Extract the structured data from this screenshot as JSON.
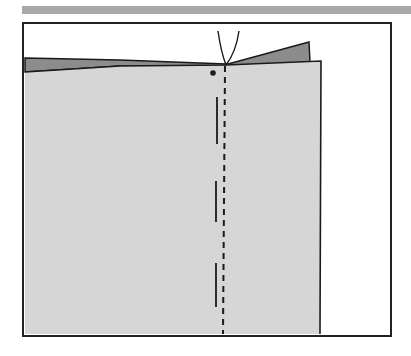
{
  "figure": {
    "type": "sewing-illustration",
    "colors": {
      "header_bar": "#a9a9a9",
      "frame_stroke": "#222222",
      "fabric_light": "#d6d6d6",
      "fabric_dark": "#8c8c8c",
      "line": "#1a1a1a",
      "background": "#ffffff"
    },
    "elements": [
      {
        "name": "header-bar"
      },
      {
        "name": "frame"
      },
      {
        "name": "fabric-under-layer"
      },
      {
        "name": "fabric-top-layer"
      },
      {
        "name": "folded-corner"
      },
      {
        "name": "needle-threads"
      },
      {
        "name": "marker-dot"
      },
      {
        "name": "stitch-line-dashed"
      },
      {
        "name": "basting-marks",
        "count": 3
      }
    ]
  }
}
